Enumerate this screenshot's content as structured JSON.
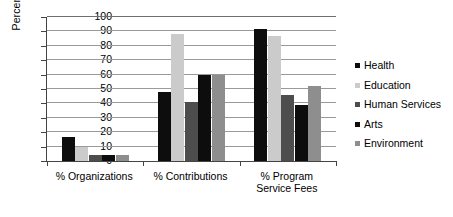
{
  "chart_data": {
    "type": "bar",
    "title": "",
    "xlabel": "",
    "ylabel": "Percent",
    "ylim": [
      0,
      100
    ],
    "ytick_step": 10,
    "yticks": [
      0,
      10,
      20,
      30,
      40,
      50,
      60,
      70,
      80,
      90,
      100
    ],
    "grid": true,
    "legend_position": "right",
    "categories": [
      "% Organizations",
      "% Contributions",
      "% Program\nService Fees"
    ],
    "series": [
      {
        "name": "Health",
        "color": "#0d0d0d",
        "values": [
          17,
          48,
          92
        ]
      },
      {
        "name": "Education",
        "color": "#cbcbcb",
        "values": [
          10,
          88,
          87
        ]
      },
      {
        "name": "Human Services",
        "color": "#4d4d4d",
        "values": [
          4,
          41,
          46
        ]
      },
      {
        "name": "Arts",
        "color": "#0d0d0d",
        "values": [
          4,
          60,
          39
        ]
      },
      {
        "name": "Environment",
        "color": "#8e8e8e",
        "values": [
          4,
          60,
          52
        ]
      }
    ]
  }
}
